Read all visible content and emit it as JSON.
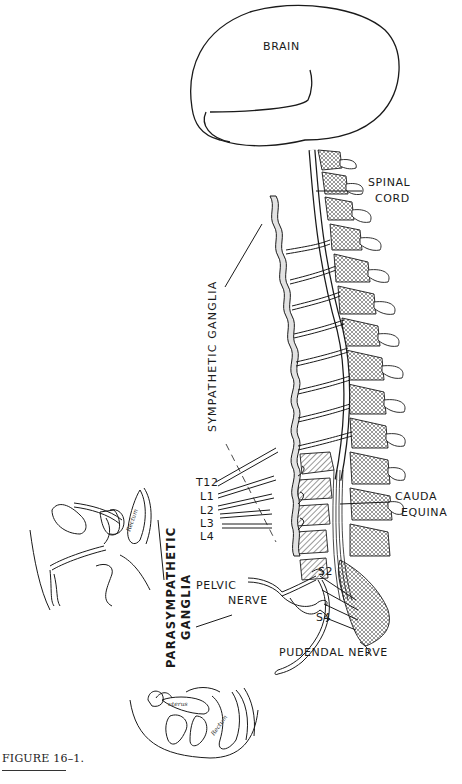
{
  "figure": {
    "caption": "FIGURE 16–1.",
    "labels": {
      "brain": "BRAIN",
      "spinal_cord": [
        "SPINAL",
        "CORD"
      ],
      "sympathetic_ganglia": "SYMPATHETIC GANGLIA",
      "cauda_equina": [
        "CAUDA",
        "EQUINA"
      ],
      "pelvic_nerve": [
        "PELVIC",
        "NERVE"
      ],
      "parasympathetic_ganglia": [
        "PARASYMPATHETIC",
        "GANGLIA"
      ],
      "pudendal_nerve": "PUDENDAL NERVE",
      "s2": "S2",
      "s4": "S4"
    },
    "vertebral_levels": [
      "T12",
      "L1",
      "L2",
      "L3",
      "L4"
    ],
    "inset_labels": {
      "male_rectum": "Rectum",
      "female_uterus": "uterus",
      "female_rectum": "Rectum"
    },
    "colors": {
      "ink": "#1a1a1a",
      "shade": "#d9d9d9",
      "paper": "#ffffff"
    }
  }
}
